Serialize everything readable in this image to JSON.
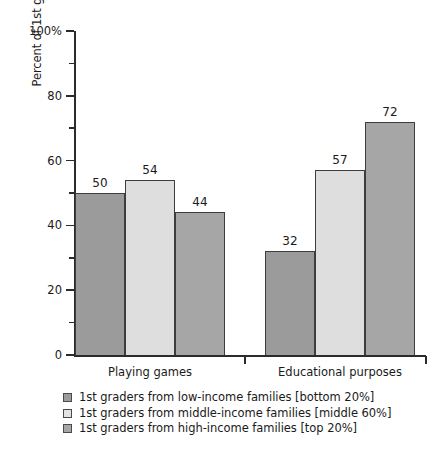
{
  "chart_data": {
    "type": "bar",
    "title": "",
    "xlabel": "",
    "ylabel": "Percent of 1st graders who used computers",
    "ylim": [
      0,
      100
    ],
    "grid": false,
    "legend_position": "below",
    "categories": [
      "Playing games",
      "Educational purposes"
    ],
    "series": [
      {
        "name": "1st graders from low-income families [bottom 20%]",
        "color": "#9b9b9b",
        "values": [
          50,
          32
        ]
      },
      {
        "name": "1st graders from middle-income families [middle 60%]",
        "color": "#dedede",
        "values": [
          54,
          57
        ]
      },
      {
        "name": "1st graders from high-income families [top 20%]",
        "color": "#a6a6a6",
        "values": [
          44,
          72
        ]
      }
    ],
    "y_ticks": [
      {
        "value": 100,
        "label": "100%"
      },
      {
        "value": 80,
        "label": "80"
      },
      {
        "value": 60,
        "label": "60"
      },
      {
        "value": 40,
        "label": "40"
      },
      {
        "value": 20,
        "label": "20"
      },
      {
        "value": 0,
        "label": "0"
      }
    ],
    "y_minor_ticks": [
      90,
      70,
      50,
      30,
      10
    ],
    "value_labels": [
      {
        "text": "50"
      },
      {
        "text": "54"
      },
      {
        "text": "44"
      },
      {
        "text": "32"
      },
      {
        "text": "57"
      },
      {
        "text": "72"
      }
    ]
  },
  "axis": {
    "line_color": "#2b2b2b"
  }
}
